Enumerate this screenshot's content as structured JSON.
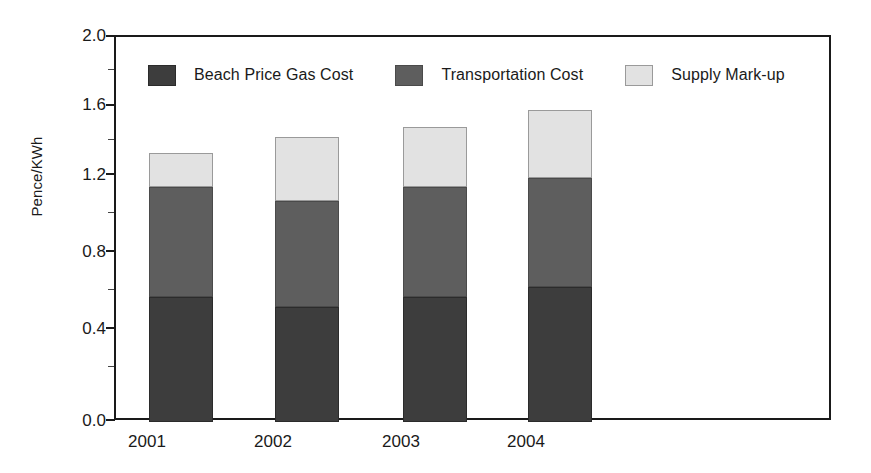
{
  "chart_data": {
    "type": "bar",
    "subtype": "stacked-bar",
    "title": "",
    "xlabel": "",
    "ylabel": "Pence/KWh",
    "categories": [
      "2001",
      "2002",
      "2003",
      "2004"
    ],
    "ylim": [
      0.0,
      2.0
    ],
    "ytick_labels": [
      "0.0",
      "0.4",
      "0.8",
      "1.2",
      "1.6",
      "2.0"
    ],
    "ytick_values": [
      0.0,
      0.4,
      0.8,
      1.2,
      1.6,
      2.0
    ],
    "minor_ticks": [
      0.2,
      0.6,
      1.0,
      1.4,
      1.8
    ],
    "grid": false,
    "legend_position": "top-inside",
    "series": [
      {
        "name": "Beach Price Gas Cost",
        "color": "#3d3d3d",
        "values": [
          0.65,
          0.6,
          0.65,
          0.7
        ]
      },
      {
        "name": "Transportation Cost",
        "color": "#5e5e5e",
        "values": [
          0.57,
          0.55,
          0.57,
          0.57
        ]
      },
      {
        "name": "Supply Mark-up",
        "color": "#e2e2e2",
        "values": [
          0.18,
          0.33,
          0.31,
          0.35
        ]
      }
    ],
    "cumulative_tops": [
      [
        0.65,
        1.22,
        1.4
      ],
      [
        0.6,
        1.15,
        1.48
      ],
      [
        0.65,
        1.22,
        1.53
      ],
      [
        0.7,
        1.27,
        1.62
      ]
    ],
    "totals": [
      1.4,
      1.48,
      1.53,
      1.62
    ]
  },
  "axis": {
    "y_title": "Pence/KWh",
    "y_labels": [
      "2.0",
      "1.6",
      "1.2",
      "0.8",
      "0.4",
      "0.0"
    ],
    "x_labels": [
      "2001",
      "2002",
      "2003",
      "2004"
    ]
  },
  "legend": {
    "items": [
      {
        "label": "Beach Price Gas Cost",
        "color": "#3d3d3d"
      },
      {
        "label": "Transportation Cost",
        "color": "#5e5e5e"
      },
      {
        "label": "Supply Mark-up",
        "color": "#e2e2e2"
      }
    ]
  },
  "colors": {
    "beach": "#3d3d3d",
    "transport": "#5e5e5e",
    "supply": "#e2e2e2",
    "axis": "#1a1a1a",
    "background": "#ffffff"
  }
}
